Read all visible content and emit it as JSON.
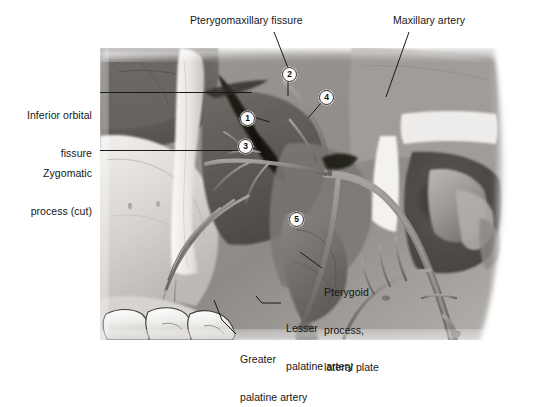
{
  "figure": {
    "type": "anatomical-illustration",
    "palette": {
      "background": "#ffffff",
      "text": "#161616",
      "leader_line": "#1b1b1b",
      "marker_fill": "#fbfbfb",
      "marker_border": "#2a2a2a",
      "bone_light": "#e9e7e4",
      "bone_mid": "#b9b5b0",
      "bone_shadow": "#6f6b67",
      "cavity_dark": "#3a3835",
      "vessel": "#8d8884"
    }
  },
  "labels": [
    {
      "id": "pterygomaxillary-fissure",
      "text": "Pterygomaxillary fissure",
      "align": "left",
      "x": 190,
      "y": 18
    },
    {
      "id": "maxillary-artery",
      "text": "Maxillary artery",
      "align": "left",
      "x": 393,
      "y": 18
    },
    {
      "id": "inferior-orbital-fissure",
      "line1": "Inferior orbital",
      "line2": "fissure",
      "align": "right",
      "x": 22,
      "y": 86
    },
    {
      "id": "zygomatic-process-cut",
      "line1": "Zygomatic",
      "line2": "process (cut)",
      "align": "right",
      "x": 22,
      "y": 144
    },
    {
      "id": "pterygoid-process-lateral-plate",
      "line1": "Pterygoid",
      "line2": "process,",
      "line3": "lateral plate",
      "align": "left",
      "x": 324,
      "y": 264
    },
    {
      "id": "lesser-palatine-artery",
      "line1": "Lesser",
      "line2": "palatine artery",
      "align": "left",
      "x": 283,
      "y": 299
    },
    {
      "id": "greater-palatine-artery",
      "line1": "Greater",
      "line2": "palatine artery",
      "align": "left",
      "x": 238,
      "y": 330
    }
  ],
  "markers": [
    {
      "id": "marker-1",
      "number": "1",
      "x": 240,
      "y": 111
    },
    {
      "id": "marker-2",
      "number": "2",
      "x": 282,
      "y": 67
    },
    {
      "id": "marker-3",
      "number": "3",
      "x": 238,
      "y": 139
    },
    {
      "id": "marker-4",
      "number": "4",
      "x": 319,
      "y": 90
    },
    {
      "id": "marker-5",
      "number": "5",
      "x": 289,
      "y": 212
    }
  ]
}
